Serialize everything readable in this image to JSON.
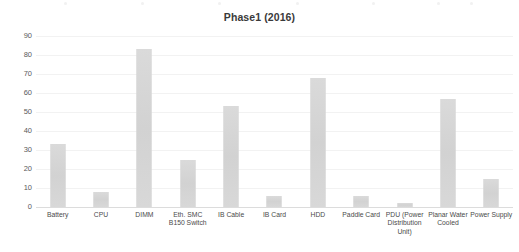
{
  "chart_data": {
    "type": "bar",
    "title": "Phase1 (2016)",
    "xlabel": "",
    "ylabel": "",
    "ylim": [
      0,
      90
    ],
    "ytick_step": 10,
    "yticks": [
      90,
      80,
      70,
      60,
      50,
      40,
      30,
      20,
      10,
      0
    ],
    "grid": true,
    "legend": "none",
    "bar_color": "#d6d6d6",
    "categories": [
      "Battery",
      "CPU",
      "DIMM",
      "Eth. SMC\nB150 Switch",
      "IB Cable",
      "IB Card",
      "HDD",
      "Paddle Card",
      "PDU (Power\nDistribution\nUnit)",
      "Planar Water\nCooled",
      "Power Supply"
    ],
    "values": [
      33,
      8,
      83,
      25,
      53,
      6,
      68,
      6,
      2,
      57,
      15
    ],
    "series": [
      {
        "name": "Phase1 (2016)",
        "values": [
          33,
          8,
          83,
          25,
          53,
          6,
          68,
          6,
          2,
          57,
          15
        ]
      }
    ]
  },
  "chart": {
    "title": "Phase1 (2016)"
  }
}
